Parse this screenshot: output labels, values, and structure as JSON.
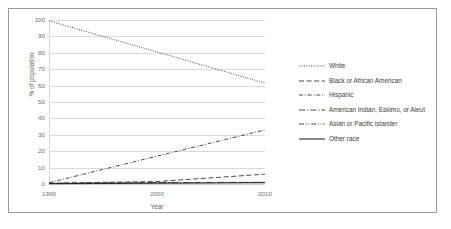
{
  "chart_data": {
    "type": "line",
    "title": "",
    "xlabel": "Year",
    "ylabel": "% of population",
    "x": [
      1990,
      2000,
      2010
    ],
    "xticklabels": [
      "1990",
      "2000",
      "2010"
    ],
    "yticks": [
      0,
      10,
      20,
      30,
      40,
      50,
      60,
      70,
      80,
      90,
      100
    ],
    "yticklabels": [
      "0",
      "10",
      "20",
      "30",
      "40",
      "50",
      "60",
      "70",
      "80",
      "90",
      "100"
    ],
    "ylim": [
      0,
      100
    ],
    "xlim": [
      1990,
      2010
    ],
    "grid": "horizontal",
    "legend_position": "right",
    "series": [
      {
        "name": "White",
        "values": [
          99.5,
          80.5,
          61.5
        ],
        "linestyle": "dotted",
        "color": "#3f3f3f"
      },
      {
        "name": "Black or African American",
        "values": [
          0.5,
          1.5,
          6.0
        ],
        "linestyle": "dashed",
        "color": "#3f3f3f"
      },
      {
        "name": "Hispanic",
        "values": [
          0.8,
          17.0,
          33.0
        ],
        "linestyle": "dashdot",
        "color": "#3f3f3f"
      },
      {
        "name": "American Indian, Eskimo, or Aleut",
        "values": [
          0.4,
          0.9,
          1.0
        ],
        "linestyle": "longdashdot",
        "color": "#3f3f3f"
      },
      {
        "name": "Asian or Pacific Islander",
        "values": [
          0.3,
          0.8,
          1.0
        ],
        "linestyle": "dashdotdot",
        "color": "#3f3f3f"
      },
      {
        "name": "Other race",
        "values": [
          0.2,
          0.5,
          0.8
        ],
        "linestyle": "solid",
        "color": "#2b2b2b"
      }
    ]
  },
  "style": {
    "grid_color": "#d9d9d9",
    "tick_label_color": "#6e6e6e",
    "axis_title_color": "#5f5f5f",
    "legend_text_color": "#3d3d3d",
    "border_color": "#9a9a9a",
    "background": "#ffffff"
  }
}
